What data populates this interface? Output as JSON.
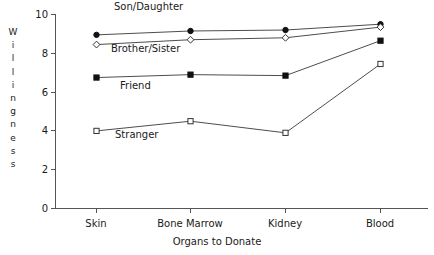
{
  "chart_data": {
    "type": "line",
    "title": "",
    "xlabel": "Organs to Donate",
    "ylabel": "Willingness",
    "categories": [
      "Skin",
      "Bone Marrow",
      "Kidney",
      "Blood"
    ],
    "ylim": [
      0,
      10
    ],
    "yticks": [
      0,
      2,
      4,
      6,
      8,
      10
    ],
    "grid": false,
    "legend_position": "inline-annotations",
    "series": [
      {
        "name": "Son/Daughter",
        "marker": "filled-circle",
        "values": [
          8.95,
          9.15,
          9.2,
          9.5
        ]
      },
      {
        "name": "Brother/Sister",
        "marker": "open-diamond",
        "values": [
          8.45,
          8.7,
          8.8,
          9.35
        ]
      },
      {
        "name": "Friend",
        "marker": "filled-square",
        "values": [
          6.75,
          6.9,
          6.85,
          8.65
        ]
      },
      {
        "name": "Stranger",
        "marker": "open-square",
        "values": [
          4.0,
          4.5,
          3.9,
          7.45
        ]
      }
    ],
    "annotations": [
      {
        "text": "Son/Daughter",
        "x_px": 114,
        "y_px": 2
      },
      {
        "text": "Brother/Sister",
        "x_px": 111,
        "y_px": 44
      },
      {
        "text": "Friend",
        "x_px": 120,
        "y_px": 81
      },
      {
        "text": "Stranger",
        "x_px": 115,
        "y_px": 130
      }
    ],
    "colors": {
      "axis": "#555555",
      "line": "#4d4d4d",
      "marker_fill": "#111111",
      "marker_open_fill": "#ffffff",
      "text": "#1a1a1a",
      "background": "#ffffff"
    }
  },
  "axis": {
    "y_title_letters": [
      "W",
      "i",
      "l",
      "l",
      "i",
      "n",
      "g",
      "n",
      "e",
      "s",
      "s"
    ],
    "y_tick_labels": [
      "10",
      "8",
      "6",
      "4",
      "2",
      "0"
    ],
    "x_tick_labels": [
      "Skin",
      "Bone Marrow",
      "Kidney",
      "Blood"
    ],
    "x_title": "Organs to Donate"
  }
}
